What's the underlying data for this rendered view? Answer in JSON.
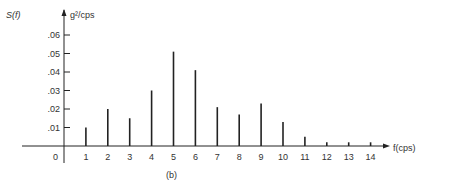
{
  "chart_data": {
    "type": "bar",
    "title": "",
    "caption": "(b)",
    "ylabel": "S(f)",
    "yunits": "g²/cps",
    "xlabel": "f(cps)",
    "x_origin_label": "0",
    "categories": [
      "1",
      "2",
      "3",
      "4",
      "5",
      "6",
      "7",
      "8",
      "9",
      "10",
      "11",
      "12",
      "13",
      "14"
    ],
    "values": [
      0.01,
      0.02,
      0.015,
      0.03,
      0.051,
      0.041,
      0.021,
      0.017,
      0.023,
      0.013,
      0.005,
      0.002,
      0.002,
      0.002
    ],
    "yticks": [
      ".01",
      ".02",
      ".03",
      ".04",
      ".05",
      ".06"
    ],
    "ytick_values": [
      0.01,
      0.02,
      0.03,
      0.04,
      0.05,
      0.06
    ],
    "ylim": [
      0,
      0.065
    ],
    "xlim": [
      0,
      15
    ],
    "grid": false,
    "legend": null,
    "bar_style": "thin vertical lines (line spectrum)",
    "colors": {
      "line": "#222222",
      "text": "#333333"
    }
  }
}
